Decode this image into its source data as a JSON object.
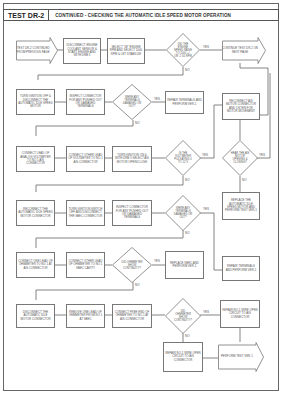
{
  "header": {
    "test_id": "TEST DR-2",
    "title": "CONTINUED - CHECKING THE AUTOMATIC IDLE SPEED MOTOR OPERATION"
  },
  "labels": {
    "yes": "YES",
    "no": "NO"
  },
  "nodes": {
    "r1_start": "TEST DR-2 CONTINUED FROM PREVIOUS PAGE",
    "r1_b2": "DISCONNECT ENGINE COOLANT SENSOR & START ENGINE AND WITH DRB II",
    "r1_b3": "SELECT \"08\" ENGINE RPM AND SELECT 1000 RPM & LET STABILIZE",
    "r1_d": "DID THE ENGINE SPEED RAISE TO 1000 +/- OR -1 50 RPM",
    "r1_end": "CONTINUE TEST DR-2 ON NEXT PAGE",
    "r2_b1": "TURN IGNITION OFF & DISCONNECT THE AUTOMATIC IDLE SPEED MOTOR",
    "r2_b2": "INSPECT CONNECTOR FOR ANY PUSHED OUT OR DAMAGED TERMINALS",
    "r2_d": "WERE ANY TERMINALS DAMAGED OR OUT?",
    "r2_b4": "REPAIR TERMINALS AND PERFORM VER-1",
    "r2_b5": "RECONNECT AIS MOTOR CONNECTOR AND LISTEN FOR MOTOR MOVEMENT",
    "r3_b1": "CONNECT LEAD OF ANALOG VOLTMETER TO NO.1 AIS CONNECTOR",
    "r3_b2": "CONNECT OTHER LEAD OF VOLTMETER TO NO.1 AIS CONNECTOR",
    "r3_b3": "TURN IGNITION ON & WITH DRB II SELECT AIS MOTOR OPEN/CLOSE",
    "r3_d": "IS THE VOLTMETER PULSATING 0 TO 12 V",
    "r3_d2": "HEAR THE AIS MOTOR OPENING & CLOSING?",
    "r4_b1": "RECONNECT THE AUTOMATIC IDLE SPEED MOTOR CONNECTOR",
    "r4_b2": "TURN IGNITION SWITCH OFF AND DISCONNECT THE SBEC CONNECTOR",
    "r4_b3": "INSPECT CONNECTOR FOR ANY PUSHED OUT OR DAMAGED TERMINALS",
    "r4_d": "WERE ANY TERMINALS DAMAGED OR OUT?",
    "r4_b5": "REPLACE THE AUTOMATIC IDLE SPEED MOTOR AND PERFORM TEST VER-1",
    "r5_b1": "CONNECT ONE LEAD OF OHMMETER TO NO.1 AT AIS CONNECTOR",
    "r5_b2": "CONNECT OTHER LEAD OF OHMMETER TO NO.1 SBEC CAVITY",
    "r5_d": "DID OHMMETER SHOW CONTINUITY?",
    "r5_b4": "REPLACE SBEC AND PERFORM VER-1",
    "r5_b5": "REPAIR TERMINALS AND PERFORM VER-1",
    "r6_b1": "DISCONNECT THE AUTOMATIC IDLE MOTOR CONNECTOR",
    "r6_b2": "REMOVE ONE LEAD OF OHMMETER FROM NO.1 AT SBEC",
    "r6_b3": "CONNECT FREE END OF OHMMETER TO NO.1 AT AIS CONNECTOR",
    "r6_d": "DID OHMMETER SHOW CONTINUITY?",
    "r6_b5": "REPAIR NO.1 WIRE OPEN CIRCUIT TO AIS CONNECTOR",
    "r7_b1": "REPAIR NO.1 WIRE OPEN CIRCUIT TO AIS CONNECTOR",
    "r7_end": "PERFORM TEST VER-1"
  }
}
